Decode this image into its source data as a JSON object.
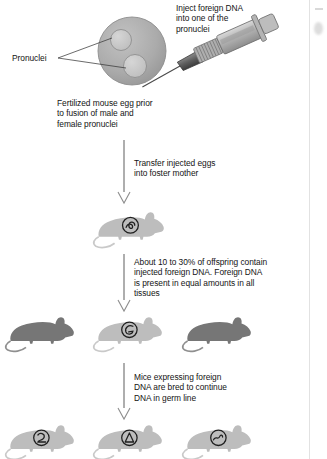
{
  "figure": {
    "background_color": "#ffffff",
    "text_color": "#141414"
  },
  "labels": {
    "inject": "Inject foreign DNA\ninto one of the\npronuclei",
    "pronuclei": "Pronuclei",
    "fertilized_egg": "Fertilized mouse egg prior\nto fusion of male and\nfemale pronuclei"
  },
  "steps": [
    {
      "id": "transfer",
      "caption": "Transfer injected eggs\ninto foster mother"
    },
    {
      "id": "offspring",
      "caption": "About 10 to 30% of offspring contain\ninjected foreign DNA.  Foreign DNA\nis present in equal amounts in all\ntissues"
    },
    {
      "id": "breeding",
      "caption": "Mice expressing foreign\nDNA are bred to continue\nDNA in germ line"
    }
  ],
  "egg": {
    "cell_color": "#a8a8a8",
    "pronucleus_color": "#c9c9c9",
    "pronuclei_count": 2
  },
  "syringe": {
    "barrel_color": "#b9b9b9",
    "needle_color": "#5a5a5a"
  },
  "mouse_rows": [
    {
      "id": "foster-mother",
      "mice": [
        {
          "shade": "light",
          "color": "#bdbdbd",
          "marked": true,
          "marking": "transgene-circle-1"
        }
      ]
    },
    {
      "id": "first-generation-offspring",
      "mice": [
        {
          "shade": "dark",
          "color": "#767676",
          "marked": false,
          "marking": ""
        },
        {
          "shade": "light",
          "color": "#bdbdbd",
          "marked": true,
          "marking": "transgene-circle-2"
        },
        {
          "shade": "dark",
          "color": "#767676",
          "marked": false,
          "marking": ""
        }
      ]
    },
    {
      "id": "germ-line-generation",
      "mice": [
        {
          "shade": "light",
          "color": "#bdbdbd",
          "marked": true,
          "marking": "transgene-circle-3"
        },
        {
          "shade": "light",
          "color": "#bdbdbd",
          "marked": true,
          "marking": "transgene-circle-4"
        },
        {
          "shade": "light",
          "color": "#bdbdbd",
          "marked": true,
          "marking": "transgene-circle-5"
        }
      ]
    }
  ],
  "arrows": {
    "color": "#9a9a9a",
    "count": 3,
    "style": "open-arrowhead"
  }
}
